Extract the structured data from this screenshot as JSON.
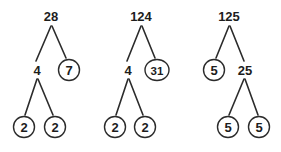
{
  "diagram": {
    "type": "factor-trees",
    "background_color": "#ffffff",
    "stroke_color": "#2b2b2b",
    "text_color": "#1d1d1d",
    "trees": [
      {
        "name": "factor-tree-28",
        "root_value": "28",
        "nodes": [
          {
            "id": "t1-root",
            "label": "28",
            "circled": false,
            "x": 51,
            "y": 16,
            "rx": 0,
            "ry": 0
          },
          {
            "id": "t1-left",
            "label": "4",
            "circled": false,
            "x": 37,
            "y": 70,
            "rx": 0,
            "ry": 0
          },
          {
            "id": "t1-right",
            "label": "7",
            "circled": true,
            "x": 69,
            "y": 70,
            "rx": 10.5,
            "ry": 10.5
          },
          {
            "id": "t1-ll",
            "label": "2",
            "circled": true,
            "x": 24,
            "y": 127,
            "rx": 10.5,
            "ry": 10.5
          },
          {
            "id": "t1-lr",
            "label": "2",
            "circled": true,
            "x": 55,
            "y": 127,
            "rx": 10.5,
            "ry": 10.5
          }
        ],
        "edges": [
          {
            "from": "t1-root",
            "to": "t1-left",
            "x1": 51,
            "y1": 26,
            "x2": 36,
            "y2": 61
          },
          {
            "from": "t1-root",
            "to": "t1-right",
            "x1": 52,
            "y1": 26,
            "x2": 66,
            "y2": 58
          },
          {
            "from": "t1-left",
            "to": "t1-ll",
            "x1": 37,
            "y1": 79,
            "x2": 25,
            "y2": 115
          },
          {
            "from": "t1-left",
            "to": "t1-lr",
            "x1": 38,
            "y1": 79,
            "x2": 53,
            "y2": 115
          }
        ]
      },
      {
        "name": "factor-tree-124",
        "root_value": "124",
        "nodes": [
          {
            "id": "t2-root",
            "label": "124",
            "circled": false,
            "x": 141,
            "y": 16,
            "rx": 0,
            "ry": 0
          },
          {
            "id": "t2-left",
            "label": "4",
            "circled": false,
            "x": 128,
            "y": 70,
            "rx": 0,
            "ry": 0
          },
          {
            "id": "t2-right",
            "label": "31",
            "circled": true,
            "x": 157,
            "y": 70,
            "rx": 12,
            "ry": 10.5
          },
          {
            "id": "t2-ll",
            "label": "2",
            "circled": true,
            "x": 115,
            "y": 127,
            "rx": 10.5,
            "ry": 10.5
          },
          {
            "id": "t2-lr",
            "label": "2",
            "circled": true,
            "x": 145,
            "y": 127,
            "rx": 10.5,
            "ry": 10.5
          }
        ],
        "edges": [
          {
            "from": "t2-root",
            "to": "t2-left",
            "x1": 141,
            "y1": 26,
            "x2": 127,
            "y2": 61
          },
          {
            "from": "t2-root",
            "to": "t2-right",
            "x1": 142,
            "y1": 26,
            "x2": 155,
            "y2": 58
          },
          {
            "from": "t2-left",
            "to": "t2-ll",
            "x1": 128,
            "y1": 79,
            "x2": 116,
            "y2": 115
          },
          {
            "from": "t2-left",
            "to": "t2-lr",
            "x1": 129,
            "y1": 79,
            "x2": 143,
            "y2": 115
          }
        ]
      },
      {
        "name": "factor-tree-125",
        "root_value": "125",
        "nodes": [
          {
            "id": "t3-root",
            "label": "125",
            "circled": false,
            "x": 229,
            "y": 16,
            "rx": 0,
            "ry": 0
          },
          {
            "id": "t3-left",
            "label": "5",
            "circled": true,
            "x": 214,
            "y": 70,
            "rx": 10.5,
            "ry": 10.5
          },
          {
            "id": "t3-right",
            "label": "25",
            "circled": false,
            "x": 245,
            "y": 70,
            "rx": 0,
            "ry": 0
          },
          {
            "id": "t3-rl",
            "label": "5",
            "circled": true,
            "x": 228,
            "y": 127,
            "rx": 10.5,
            "ry": 10.5
          },
          {
            "id": "t3-rr",
            "label": "5",
            "circled": true,
            "x": 259,
            "y": 127,
            "rx": 10.5,
            "ry": 10.5
          }
        ],
        "edges": [
          {
            "from": "t3-root",
            "to": "t3-left",
            "x1": 229,
            "y1": 26,
            "x2": 216,
            "y2": 58
          },
          {
            "from": "t3-root",
            "to": "t3-right",
            "x1": 230,
            "y1": 26,
            "x2": 244,
            "y2": 61
          },
          {
            "from": "t3-right",
            "to": "t3-rl",
            "x1": 244,
            "y1": 79,
            "x2": 229,
            "y2": 115
          },
          {
            "from": "t3-right",
            "to": "t3-rr",
            "x1": 245,
            "y1": 79,
            "x2": 258,
            "y2": 115
          }
        ]
      }
    ]
  }
}
